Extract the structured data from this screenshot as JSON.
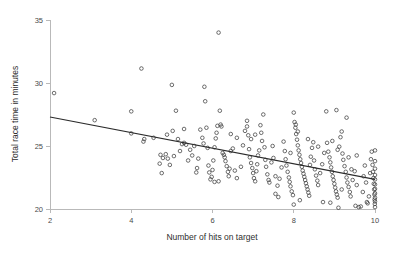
{
  "chart_data": {
    "type": "scatter",
    "title": "",
    "xlabel": "Number of hits on target",
    "ylabel": "Total race time in minutes",
    "xlim": [
      2,
      10
    ],
    "ylim": [
      20,
      35
    ],
    "xticks": [
      2,
      4,
      6,
      8,
      10
    ],
    "xtick_labels": [
      "2",
      "4",
      "6",
      "8",
      "10"
    ],
    "yticks": [
      20,
      25,
      30,
      35
    ],
    "ytick_labels": [
      "20",
      "25",
      "30",
      "35"
    ],
    "grid": false,
    "legend": null,
    "marker": "open-circle",
    "marker_color": "#3d3d3d",
    "line_color": "#2b2b2b",
    "background_color": "#ffffff",
    "axis_color": "#b9b9b9",
    "trend_line": {
      "name": "linear fit",
      "x": [
        2.0,
        10.0
      ],
      "y": [
        27.3,
        22.35
      ],
      "slope": -0.619,
      "intercept": 28.54
    },
    "series": [
      {
        "name": "observations",
        "points": [
          [
            2.1,
            29.2
          ],
          [
            3.1,
            27.05
          ],
          [
            4.0,
            27.75
          ],
          [
            4.0,
            26.0
          ],
          [
            4.25,
            31.15
          ],
          [
            4.3,
            25.35
          ],
          [
            4.32,
            25.55
          ],
          [
            4.55,
            25.65
          ],
          [
            4.7,
            23.6
          ],
          [
            4.72,
            24.3
          ],
          [
            4.75,
            22.85
          ],
          [
            4.78,
            24.05
          ],
          [
            4.85,
            24.35
          ],
          [
            4.9,
            24.0
          ],
          [
            4.95,
            23.5
          ],
          [
            5.0,
            29.85
          ],
          [
            5.02,
            26.2
          ],
          [
            5.05,
            24.2
          ],
          [
            5.1,
            27.8
          ],
          [
            5.15,
            25.55
          ],
          [
            5.2,
            24.6
          ],
          [
            5.25,
            25.15
          ],
          [
            5.3,
            25.25
          ],
          [
            5.35,
            25.1
          ],
          [
            5.4,
            23.85
          ],
          [
            5.45,
            24.7
          ],
          [
            5.5,
            24.25
          ],
          [
            5.55,
            25.0
          ],
          [
            5.6,
            22.9
          ],
          [
            5.62,
            23.25
          ],
          [
            5.65,
            24.0
          ],
          [
            5.7,
            26.3
          ],
          [
            5.75,
            25.65
          ],
          [
            5.8,
            29.7
          ],
          [
            5.82,
            28.55
          ],
          [
            5.85,
            26.45
          ],
          [
            5.88,
            24.85
          ],
          [
            5.9,
            23.45
          ],
          [
            5.92,
            22.9
          ],
          [
            5.95,
            22.35
          ],
          [
            5.98,
            22.55
          ],
          [
            6.0,
            23.1
          ],
          [
            6.02,
            23.85
          ],
          [
            6.05,
            24.9
          ],
          [
            6.08,
            25.6
          ],
          [
            6.1,
            26.05
          ],
          [
            6.12,
            26.6
          ],
          [
            6.15,
            34.0
          ],
          [
            6.18,
            27.8
          ],
          [
            6.2,
            26.7
          ],
          [
            6.22,
            26.55
          ],
          [
            6.25,
            24.45
          ],
          [
            6.28,
            24.3
          ],
          [
            6.3,
            24.1
          ],
          [
            6.32,
            23.8
          ],
          [
            6.35,
            23.4
          ],
          [
            6.38,
            22.95
          ],
          [
            6.4,
            22.6
          ],
          [
            6.42,
            23.2
          ],
          [
            6.45,
            24.6
          ],
          [
            6.5,
            24.8
          ],
          [
            6.55,
            23.05
          ],
          [
            6.6,
            22.45
          ],
          [
            6.7,
            23.35
          ],
          [
            6.75,
            25.05
          ],
          [
            6.8,
            26.2
          ],
          [
            6.85,
            26.55
          ],
          [
            6.88,
            25.85
          ],
          [
            6.9,
            24.75
          ],
          [
            6.92,
            24.1
          ],
          [
            6.95,
            23.65
          ],
          [
            6.98,
            23.25
          ],
          [
            7.0,
            22.85
          ],
          [
            7.02,
            22.45
          ],
          [
            7.05,
            22.2
          ],
          [
            7.08,
            23.0
          ],
          [
            7.1,
            23.55
          ],
          [
            7.12,
            24.25
          ],
          [
            7.15,
            24.65
          ],
          [
            7.18,
            26.65
          ],
          [
            7.2,
            26.05
          ],
          [
            7.22,
            25.4
          ],
          [
            7.25,
            27.5
          ],
          [
            7.28,
            24.9
          ],
          [
            7.3,
            23.9
          ],
          [
            7.32,
            23.35
          ],
          [
            7.35,
            22.75
          ],
          [
            7.38,
            22.3
          ],
          [
            7.4,
            22.1
          ],
          [
            7.45,
            23.7
          ],
          [
            7.5,
            24.05
          ],
          [
            7.55,
            22.6
          ],
          [
            7.6,
            21.85
          ],
          [
            7.65,
            22.4
          ],
          [
            7.7,
            23.3
          ],
          [
            7.75,
            25.35
          ],
          [
            7.78,
            24.6
          ],
          [
            7.8,
            23.95
          ],
          [
            7.82,
            23.45
          ],
          [
            7.85,
            22.95
          ],
          [
            7.88,
            22.5
          ],
          [
            7.9,
            22.15
          ],
          [
            7.92,
            21.8
          ],
          [
            7.95,
            21.4
          ],
          [
            7.98,
            21.1
          ],
          [
            8.0,
            20.35
          ],
          [
            8.0,
            27.65
          ],
          [
            8.02,
            26.9
          ],
          [
            8.04,
            26.45
          ],
          [
            8.06,
            25.95
          ],
          [
            8.08,
            25.5
          ],
          [
            8.1,
            25.05
          ],
          [
            8.12,
            24.65
          ],
          [
            8.14,
            24.3
          ],
          [
            8.16,
            23.95
          ],
          [
            8.18,
            23.65
          ],
          [
            8.2,
            23.35
          ],
          [
            8.22,
            23.05
          ],
          [
            8.24,
            22.8
          ],
          [
            8.26,
            22.55
          ],
          [
            8.28,
            22.3
          ],
          [
            8.3,
            22.05
          ],
          [
            8.32,
            21.8
          ],
          [
            8.34,
            21.55
          ],
          [
            8.36,
            21.3
          ],
          [
            8.38,
            21.05
          ],
          [
            8.4,
            23.5
          ],
          [
            8.42,
            24.15
          ],
          [
            8.45,
            24.85
          ],
          [
            8.48,
            25.3
          ],
          [
            8.5,
            23.85
          ],
          [
            8.52,
            23.15
          ],
          [
            8.55,
            22.65
          ],
          [
            8.58,
            22.25
          ],
          [
            8.6,
            21.9
          ],
          [
            8.65,
            22.85
          ],
          [
            8.7,
            23.55
          ],
          [
            8.75,
            24.45
          ],
          [
            8.8,
            27.75
          ],
          [
            8.82,
            25.25
          ],
          [
            8.85,
            24.55
          ],
          [
            8.88,
            24.1
          ],
          [
            8.9,
            23.7
          ],
          [
            8.92,
            23.3
          ],
          [
            8.94,
            22.95
          ],
          [
            8.96,
            22.6
          ],
          [
            8.98,
            22.3
          ],
          [
            9.0,
            22.0
          ],
          [
            9.02,
            21.7
          ],
          [
            9.04,
            21.4
          ],
          [
            9.06,
            21.15
          ],
          [
            9.08,
            20.9
          ],
          [
            9.1,
            20.1
          ],
          [
            9.12,
            24.95
          ],
          [
            9.15,
            25.7
          ],
          [
            9.18,
            26.15
          ],
          [
            9.2,
            24.4
          ],
          [
            9.22,
            23.9
          ],
          [
            9.25,
            23.4
          ],
          [
            9.28,
            22.95
          ],
          [
            9.3,
            22.5
          ],
          [
            9.32,
            22.1
          ],
          [
            9.35,
            21.75
          ],
          [
            9.38,
            21.35
          ],
          [
            9.4,
            21.0
          ],
          [
            9.45,
            22.3
          ],
          [
            9.5,
            23.0
          ],
          [
            9.55,
            21.9
          ],
          [
            9.6,
            20.15
          ],
          [
            9.65,
            20.2
          ],
          [
            9.7,
            21.35
          ],
          [
            9.72,
            22.6
          ],
          [
            9.75,
            23.45
          ],
          [
            9.78,
            22.1
          ],
          [
            9.8,
            20.55
          ],
          [
            9.82,
            20.45
          ],
          [
            9.85,
            21.0
          ],
          [
            9.88,
            22.85
          ],
          [
            9.9,
            23.95
          ],
          [
            9.92,
            24.55
          ],
          [
            9.94,
            23.5
          ],
          [
            9.95,
            22.95
          ],
          [
            9.96,
            22.45
          ],
          [
            9.97,
            22.0
          ],
          [
            9.98,
            21.55
          ],
          [
            9.985,
            21.15
          ],
          [
            9.99,
            20.75
          ],
          [
            9.995,
            20.4
          ],
          [
            10.0,
            20.15
          ],
          [
            10.0,
            24.65
          ],
          [
            10.0,
            23.8
          ],
          [
            10.0,
            23.2
          ],
          [
            10.0,
            22.7
          ],
          [
            10.0,
            22.35
          ],
          [
            10.0,
            21.95
          ],
          [
            10.0,
            21.6
          ],
          [
            10.0,
            21.25
          ],
          [
            10.0,
            20.9
          ],
          [
            10.0,
            20.6
          ],
          [
            9.3,
            27.25
          ],
          [
            9.05,
            27.85
          ],
          [
            8.1,
            26.15
          ],
          [
            8.05,
            26.7
          ],
          [
            7.92,
            24.45
          ],
          [
            6.85,
            27.0
          ],
          [
            6.95,
            25.55
          ],
          [
            5.78,
            25.2
          ],
          [
            5.3,
            26.35
          ],
          [
            4.88,
            25.9
          ],
          [
            9.55,
            24.25
          ],
          [
            9.42,
            23.15
          ],
          [
            9.18,
            21.55
          ],
          [
            8.72,
            20.55
          ],
          [
            8.9,
            20.5
          ],
          [
            9.52,
            20.25
          ],
          [
            6.6,
            25.65
          ],
          [
            6.45,
            25.95
          ],
          [
            7.48,
            25.0
          ],
          [
            7.05,
            25.9
          ],
          [
            8.35,
            25.55
          ],
          [
            8.6,
            24.95
          ],
          [
            8.95,
            25.4
          ],
          [
            9.08,
            24.7
          ],
          [
            9.35,
            24.1
          ],
          [
            6.15,
            22.2
          ],
          [
            6.05,
            22.15
          ],
          [
            7.55,
            21.2
          ],
          [
            7.62,
            20.95
          ],
          [
            8.15,
            20.7
          ]
        ]
      }
    ]
  },
  "axis": {
    "x_title": "Number of hits on target",
    "y_title": "Total race time in minutes"
  }
}
